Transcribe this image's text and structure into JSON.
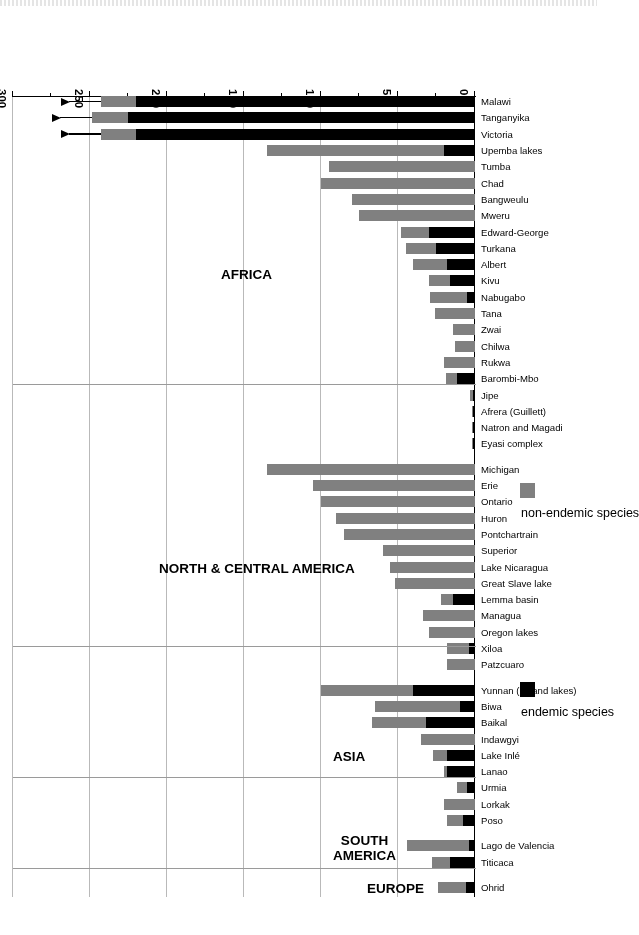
{
  "chart_data": {
    "type": "bar",
    "orientation": "horizontal-stacked",
    "title": "",
    "xlabel": "",
    "ylabel": "",
    "xlim": [
      0,
      300
    ],
    "ticks": [
      0,
      50,
      100,
      150,
      200,
      250,
      300
    ],
    "tick_labels": [
      "0",
      "50",
      "100",
      "150",
      "200",
      "250",
      "300"
    ],
    "minor_ticks": [
      25,
      75,
      125,
      175,
      225,
      275
    ],
    "grid": true,
    "legend": {
      "position": "outside-right",
      "entries": [
        {
          "label": "endemic species",
          "color": "#000000"
        },
        {
          "label": "non-endemic species",
          "color": "#808080"
        }
      ]
    },
    "series": [
      {
        "name": "endemic species",
        "color": "#000000"
      },
      {
        "name": "non-endemic species",
        "color": "#808080"
      }
    ],
    "regions": [
      {
        "name": "AFRICA",
        "lines": [
          "AFRICA"
        ]
      },
      {
        "name": "NORTH & CENTRAL AMERICA",
        "lines": [
          "NORTH & CENTRAL AMERICA"
        ]
      },
      {
        "name": "ASIA",
        "lines": [
          "ASIA"
        ]
      },
      {
        "name": "SOUTH AMERICA",
        "lines": [
          "SOUTH",
          "AMERICA"
        ]
      },
      {
        "name": "EUROPE",
        "lines": [
          "EUROPE"
        ]
      }
    ],
    "categories": [
      "Malawi",
      "Tanganyika",
      "Victoria",
      "Upemba lakes",
      "Tumba",
      "Chad",
      "Bangweulu",
      "Mweru",
      "Edward-George",
      "Turkana",
      "Albert",
      "Kivu",
      "Nabugabo",
      "Tana",
      "Zwai",
      "Chilwa",
      "Rukwa",
      "Barombi-Mbo",
      "Jipe",
      "Afrera (Guillett)",
      "Natron and Magadi",
      "Eyasi complex",
      "Michigan",
      "Erie",
      "Ontario",
      "Huron",
      "Pontchartrain",
      "Superior",
      "Lake Nicaragua",
      "Great Slave lake",
      "Lemma basin",
      "Managua",
      "Oregon lakes",
      "Xiloa",
      "Patzcuaro",
      "Yunnan (upland lakes)",
      "Biwa",
      "Baikal",
      "Indawgyi",
      "Lake Inlé",
      "Lanao",
      "Urmia",
      "Lorkak",
      "Poso",
      "Lago de Valencia",
      "Titicaca",
      "Ohrid"
    ],
    "region_of_category": [
      "AFRICA",
      "AFRICA",
      "AFRICA",
      "AFRICA",
      "AFRICA",
      "AFRICA",
      "AFRICA",
      "AFRICA",
      "AFRICA",
      "AFRICA",
      "AFRICA",
      "AFRICA",
      "AFRICA",
      "AFRICA",
      "AFRICA",
      "AFRICA",
      "AFRICA",
      "AFRICA",
      "AFRICA",
      "AFRICA",
      "AFRICA",
      "AFRICA",
      "NORTH & CENTRAL AMERICA",
      "NORTH & CENTRAL AMERICA",
      "NORTH & CENTRAL AMERICA",
      "NORTH & CENTRAL AMERICA",
      "NORTH & CENTRAL AMERICA",
      "NORTH & CENTRAL AMERICA",
      "NORTH & CENTRAL AMERICA",
      "NORTH & CENTRAL AMERICA",
      "NORTH & CENTRAL AMERICA",
      "NORTH & CENTRAL AMERICA",
      "NORTH & CENTRAL AMERICA",
      "NORTH & CENTRAL AMERICA",
      "NORTH & CENTRAL AMERICA",
      "ASIA",
      "ASIA",
      "ASIA",
      "ASIA",
      "ASIA",
      "ASIA",
      "ASIA",
      "ASIA",
      "ASIA",
      "SOUTH AMERICA",
      "SOUTH AMERICA",
      "EUROPE"
    ],
    "endemic": [
      220,
      225,
      220,
      20,
      0,
      0,
      0,
      0,
      30,
      25,
      18,
      16,
      5,
      0,
      0,
      0,
      0,
      12,
      1,
      1,
      1,
      1,
      0,
      0,
      0,
      0,
      0,
      0,
      0,
      0,
      14,
      0,
      0,
      4,
      0,
      40,
      10,
      32,
      0,
      18,
      18,
      5,
      0,
      8,
      4,
      16,
      6
    ],
    "non_endemic": [
      23,
      24,
      23,
      115,
      95,
      100,
      80,
      75,
      18,
      20,
      22,
      14,
      24,
      26,
      14,
      13,
      20,
      7,
      2,
      1,
      1,
      1,
      135,
      105,
      100,
      90,
      85,
      60,
      55,
      52,
      8,
      34,
      30,
      14,
      18,
      60,
      55,
      35,
      35,
      9,
      2,
      7,
      20,
      10,
      40,
      12,
      18
    ],
    "over_range_markers": [
      {
        "category": "Malawi",
        "note": "bar exceeds axis, arrow shown"
      },
      {
        "category": "Tanganyika",
        "note": "bar exceeds axis, arrow shown"
      },
      {
        "category": "Victoria",
        "note": "bar exceeds axis, arrow shown"
      }
    ]
  }
}
